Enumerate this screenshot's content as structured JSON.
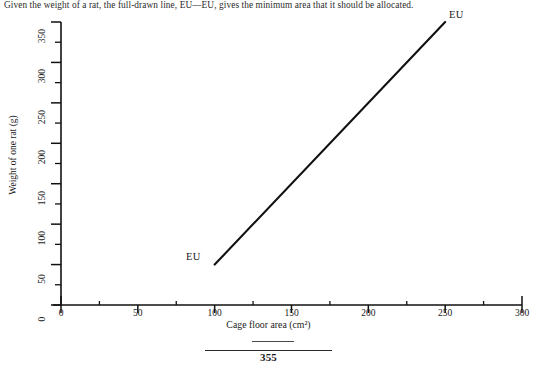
{
  "caption": {
    "text": "Given the weight of a rat, the full-drawn line, EU—EU, gives the minimum area that it should be allocated."
  },
  "footer": {
    "page_number": "355"
  },
  "chart_data": {
    "type": "line",
    "title": "",
    "xlabel": "Cage floor area (cm²)",
    "ylabel": "Weight of one rat (g)",
    "xlim": [
      0,
      300
    ],
    "ylim": [
      0,
      350
    ],
    "grid": false,
    "legend_position": "inline-endpoints",
    "x_ticks": [
      0,
      50,
      100,
      150,
      200,
      250,
      300
    ],
    "x_tick_labels": [
      "0",
      "50",
      "100",
      "150",
      "200",
      "250",
      "300"
    ],
    "x_minor_step": 25,
    "y_ticks": [
      0,
      50,
      100,
      150,
      200,
      250,
      300,
      350
    ],
    "y_tick_labels": [
      "0",
      "50",
      "100",
      "150",
      "200",
      "250",
      "300",
      "350"
    ],
    "y_minor_step": 25,
    "series": [
      {
        "name": "EU—EU",
        "label_start": "EU",
        "label_end": "EU",
        "color": "#111111",
        "x": [
          100,
          250
        ],
        "y": [
          50,
          350
        ]
      }
    ],
    "annotations": [
      {
        "text": "EU",
        "x": 100,
        "y": 50,
        "placement": "left"
      },
      {
        "text": "EU",
        "x": 250,
        "y": 350,
        "placement": "right"
      }
    ]
  }
}
